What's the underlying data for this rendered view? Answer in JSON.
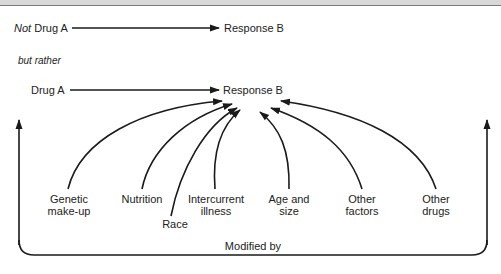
{
  "diagram": {
    "row1": {
      "prefix_italic": "Not",
      "source": "Drug A",
      "target": "Response B"
    },
    "connector": "but rather",
    "row2": {
      "source": "Drug A",
      "target": "Response B"
    },
    "factors": [
      {
        "line1": "Genetic",
        "line2": "make-up"
      },
      {
        "line1": "Nutrition",
        "line2": ""
      },
      {
        "line1": "Race",
        "line2": ""
      },
      {
        "line1": "Intercurrent",
        "line2": "illness"
      },
      {
        "line1": "Age and",
        "line2": "size"
      },
      {
        "line1": "Other",
        "line2": "factors"
      },
      {
        "line1": "Other",
        "line2": "drugs"
      }
    ],
    "bracket_label": "Modified by",
    "colors": {
      "ink": "#1a1a1a",
      "top_rule": "#7a7a7a",
      "top_band": "#d9d9d9",
      "background": "#ffffff"
    }
  }
}
